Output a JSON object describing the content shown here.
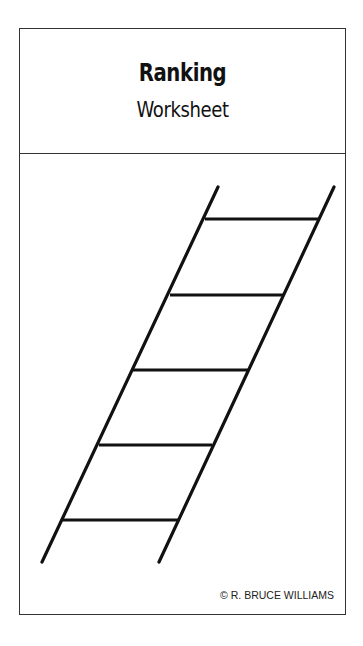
{
  "header": {
    "title": "Ranking",
    "subtitle": "Worksheet"
  },
  "ladder": {
    "rails": [
      {
        "x1": 218,
        "y1": 187,
        "x2": 42,
        "y2": 562
      },
      {
        "x1": 334,
        "y1": 187,
        "x2": 159,
        "y2": 562
      }
    ],
    "rungs": [
      {
        "y": 219,
        "x1": 205,
        "x2": 320
      },
      {
        "y": 295,
        "x1": 170,
        "x2": 284
      },
      {
        "y": 370,
        "x1": 133,
        "x2": 248
      },
      {
        "y": 445,
        "x1": 99,
        "x2": 212
      },
      {
        "y": 520,
        "x1": 62,
        "x2": 178
      }
    ],
    "stroke_color": "#111111"
  },
  "footer": {
    "credit": "© R. BRUCE WILLIAMS"
  }
}
